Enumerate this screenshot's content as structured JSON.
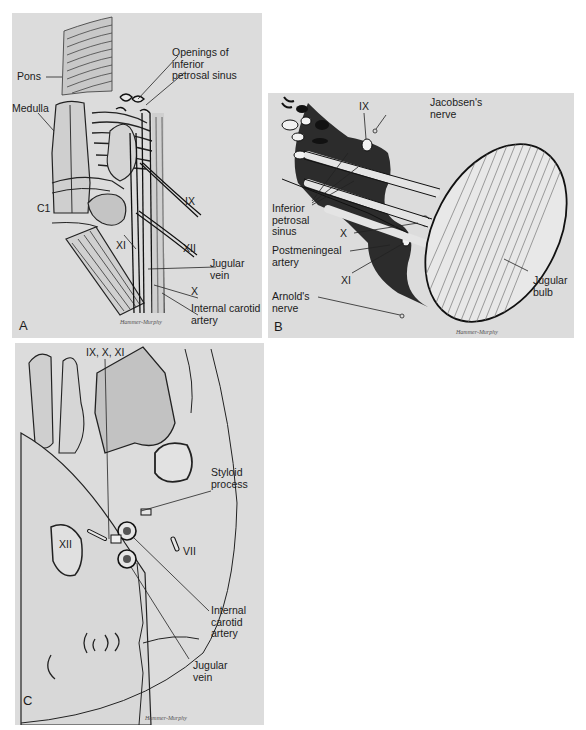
{
  "panels": {
    "a": {
      "letter": "A",
      "labels": {
        "pons": "Pons",
        "openings": "Openings of\ninferior\npetrosal sinus",
        "medulla": "Medulla",
        "c1": "C1",
        "ix": "IX",
        "xi": "XI",
        "xii": "XII",
        "jugular_vein": "Jugular\nvein",
        "x": "X",
        "internal_carotid": "Internal carotid\nartery"
      },
      "signature": "Hammer-Murphy"
    },
    "b": {
      "letter": "B",
      "labels": {
        "ix": "IX",
        "jacobsen": "Jacobsen's\nnerve",
        "inferior_petrosal": "Inferior\npetrosal\nsinus",
        "x": "X",
        "postmeningeal": "Postmeningeal\nartery",
        "xi": "XI",
        "arnold": "Arnold's\nnerve",
        "jugular_bulb": "Jugular\nbulb"
      },
      "signature": "Hammer-Murphy"
    },
    "c": {
      "letter": "C",
      "labels": {
        "ix_x_xi": "IX, X, XI",
        "styloid": "Styloid\nprocess",
        "xii": "XII",
        "vii": "VII",
        "internal_carotid": "Internal\ncarotid\nartery",
        "jugular_vein": "Jugular\nvein"
      },
      "signature": "Hammer-Murphy"
    }
  },
  "colors": {
    "panel_bg": "#dcdcdc",
    "ink": "#1b1b1b",
    "dark_fill": "#333333"
  }
}
